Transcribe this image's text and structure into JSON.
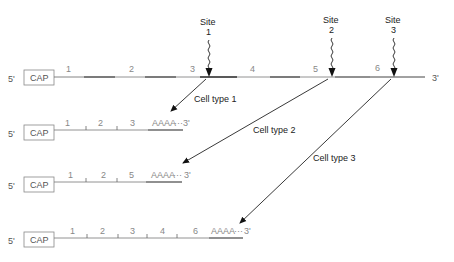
{
  "diagram": {
    "type": "alternative polyadenylation / splicing of pre-mRNA",
    "precursor": {
      "five_prime": "5'",
      "cap": "CAP",
      "three_prime": "3'",
      "exons": [
        "1",
        "2",
        "3",
        "4",
        "5",
        "6"
      ],
      "sites": [
        {
          "label": "Site",
          "number": "1"
        },
        {
          "label": "Site",
          "number": "2"
        },
        {
          "label": "Site",
          "number": "3"
        }
      ]
    },
    "cell_types": [
      {
        "label": "Cell type 1",
        "five_prime": "5'",
        "cap": "CAP",
        "exons": [
          "1",
          "2",
          "3"
        ],
        "tail": "AAAA",
        "tail_dots": "···",
        "three_prime": "3'"
      },
      {
        "label": "Cell type 2",
        "five_prime": "5'",
        "cap": "CAP",
        "exons": [
          "1",
          "2",
          "5"
        ],
        "tail": "AAAA",
        "tail_dots": "···",
        "three_prime": "3'"
      },
      {
        "label": "Cell type 3",
        "five_prime": "5'",
        "cap": "CAP",
        "exons": [
          "1",
          "2",
          "3",
          "4",
          "6"
        ],
        "tail": "AAAA",
        "tail_dots": "···",
        "three_prime": "3'"
      }
    ]
  }
}
